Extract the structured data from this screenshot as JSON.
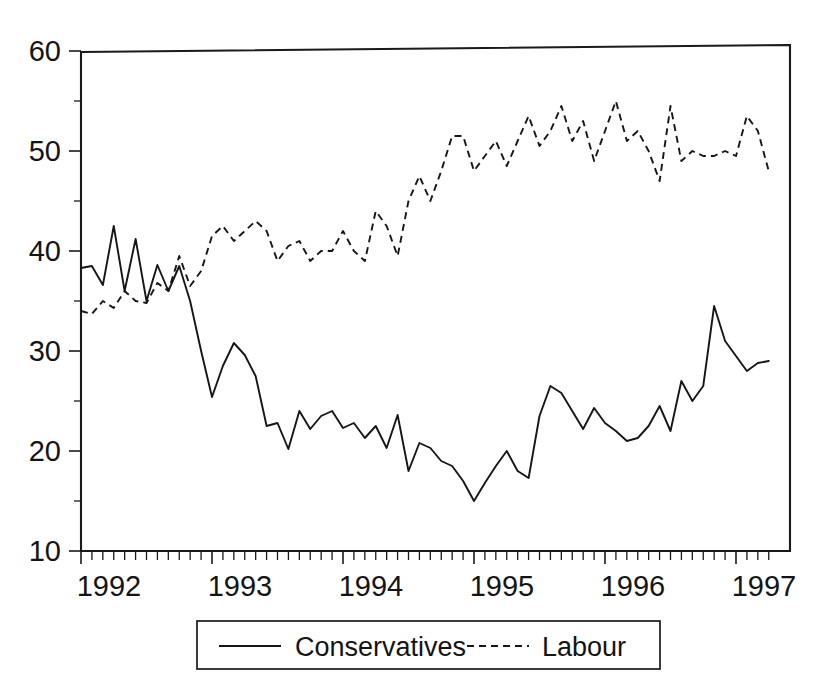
{
  "figure": {
    "top_note": "",
    "background": "#ffffff",
    "ink_color": "#161616"
  },
  "legend": {
    "position": "bottom-center",
    "entries": [
      {
        "label": "Conservatives",
        "style": "solid",
        "icon": "solid-line-icon"
      },
      {
        "label": "Labour",
        "style": "dashed",
        "icon": "dashed-line-icon"
      }
    ]
  },
  "axes": {
    "y_ticks": [
      "10",
      "20",
      "30",
      "40",
      "50",
      "60"
    ],
    "x_ticks": [
      "1992",
      "1993",
      "1994",
      "1995",
      "1996",
      "1997"
    ]
  },
  "chart_data": {
    "type": "line",
    "title": "",
    "subtitle": "",
    "xlabel": "",
    "ylabel": "",
    "xlim": [
      1992.0,
      1997.25
    ],
    "ylim": [
      10,
      60
    ],
    "grid": false,
    "legend_position": "bottom-center",
    "x_tick_labels": [
      "1992",
      "1993",
      "1994",
      "1995",
      "1996",
      "1997"
    ],
    "x_tick_values": [
      1992,
      1993,
      1994,
      1995,
      1996,
      1997
    ],
    "y_tick_labels": [
      "10",
      "20",
      "30",
      "40",
      "50",
      "60"
    ],
    "y_tick_values": [
      10,
      20,
      30,
      40,
      50,
      60
    ],
    "x_minor_tick_interval": 0.0833,
    "x": [
      1992.0,
      1992.083,
      1992.167,
      1992.25,
      1992.333,
      1992.417,
      1992.5,
      1992.583,
      1992.667,
      1992.75,
      1992.833,
      1992.917,
      1993.0,
      1993.083,
      1993.167,
      1993.25,
      1993.333,
      1993.417,
      1993.5,
      1993.583,
      1993.667,
      1993.75,
      1993.833,
      1993.917,
      1994.0,
      1994.083,
      1994.167,
      1994.25,
      1994.333,
      1994.417,
      1994.5,
      1994.583,
      1994.667,
      1994.75,
      1994.833,
      1994.917,
      1995.0,
      1995.083,
      1995.167,
      1995.25,
      1995.333,
      1995.417,
      1995.5,
      1995.583,
      1995.667,
      1995.75,
      1995.833,
      1995.917,
      1996.0,
      1996.083,
      1996.167,
      1996.25,
      1996.333,
      1996.417,
      1996.5,
      1996.583,
      1996.667,
      1996.75,
      1996.833,
      1996.917,
      1997.0,
      1997.083,
      1997.167,
      1997.25
    ],
    "series": [
      {
        "name": "Conservatives",
        "style": "solid",
        "values": [
          38.3,
          38.5,
          36.6,
          42.5,
          36.0,
          41.2,
          35.0,
          38.6,
          36.0,
          38.5,
          35.0,
          30.0,
          25.4,
          28.5,
          30.8,
          29.6,
          27.5,
          22.5,
          22.8,
          20.2,
          24.0,
          22.2,
          23.5,
          24.0,
          22.3,
          22.8,
          21.3,
          22.5,
          20.3,
          23.6,
          18.0,
          20.8,
          20.3,
          19.0,
          18.5,
          17.0,
          15.0,
          16.8,
          18.5,
          20.0,
          18.0,
          17.3,
          23.5,
          26.5,
          25.8,
          24.0,
          22.2,
          24.3,
          22.8,
          22.0,
          21.0,
          21.3,
          22.5,
          24.5,
          22.0,
          27.0,
          25.0,
          26.5,
          34.5,
          31.0,
          29.5,
          28.0,
          28.8,
          29.0
        ]
      },
      {
        "name": "Labour",
        "style": "dashed",
        "values": [
          34.0,
          33.7,
          35.0,
          34.3,
          36.0,
          35.0,
          34.8,
          36.8,
          36.0,
          39.5,
          36.5,
          38.0,
          41.5,
          42.5,
          41.0,
          42.0,
          43.0,
          42.0,
          39.0,
          40.5,
          41.0,
          39.0,
          40.0,
          40.0,
          42.0,
          40.0,
          39.0,
          44.0,
          42.5,
          39.5,
          45.0,
          47.5,
          45.0,
          48.0,
          51.5,
          51.5,
          48.0,
          49.5,
          51.0,
          48.5,
          51.0,
          53.5,
          50.5,
          52.0,
          54.5,
          51.0,
          53.0,
          49.0,
          52.0,
          55.0,
          51.0,
          52.0,
          50.0,
          47.0,
          54.5,
          49.0,
          50.0,
          49.5,
          49.5,
          50.0,
          49.5,
          53.5,
          52.0,
          48.0
        ]
      }
    ]
  }
}
